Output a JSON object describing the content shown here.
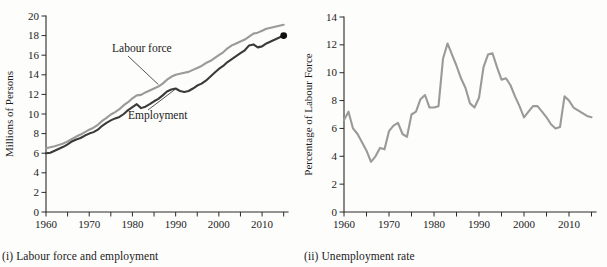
{
  "figure": {
    "background_color": "#fdfdfb",
    "panels": [
      {
        "id": "labour-force-and-employment",
        "caption": "(i) Labour force and employment"
      },
      {
        "id": "unemployment-rate",
        "caption": "(ii) Unemployment rate"
      }
    ]
  },
  "chart_data": [
    {
      "type": "line",
      "title": "",
      "caption": "(i) Labour force and employment",
      "xlabel": "Year",
      "ylabel": "Millions of Persons",
      "xlim": [
        1960,
        2016
      ],
      "ylim": [
        0,
        20
      ],
      "xticks": [
        1960,
        1970,
        1980,
        1990,
        2000,
        2010
      ],
      "xtick_labels": [
        "1960",
        "1970",
        "1980",
        "1990",
        "2000",
        "2010"
      ],
      "xminor_step": 5,
      "yticks": [
        0,
        2,
        4,
        6,
        8,
        10,
        12,
        14,
        16,
        18,
        20
      ],
      "ytick_labels": [
        "0",
        "2",
        "4",
        "6",
        "8",
        "10",
        "12",
        "14",
        "16",
        "18",
        "20"
      ],
      "grid": false,
      "legend": "inline-annotations",
      "annotations": [
        {
          "text": "Labour force",
          "series": "Labour force"
        },
        {
          "text": "Employment",
          "series": "Employment"
        }
      ],
      "end_marker": {
        "series": "Employment",
        "x": 2015,
        "y": 18.0,
        "color": "#111111"
      },
      "x": [
        1960,
        1961,
        1962,
        1963,
        1964,
        1965,
        1966,
        1967,
        1968,
        1969,
        1970,
        1971,
        1972,
        1973,
        1974,
        1975,
        1976,
        1977,
        1978,
        1979,
        1980,
        1981,
        1982,
        1983,
        1984,
        1985,
        1986,
        1987,
        1988,
        1989,
        1990,
        1991,
        1992,
        1993,
        1994,
        1995,
        1996,
        1997,
        1998,
        1999,
        2000,
        2001,
        2002,
        2003,
        2004,
        2005,
        2006,
        2007,
        2008,
        2009,
        2010,
        2011,
        2012,
        2013,
        2014,
        2015
      ],
      "series": [
        {
          "name": "Labour force",
          "color": "#9a9a9a",
          "values": [
            6.5,
            6.6,
            6.7,
            6.85,
            7.0,
            7.2,
            7.45,
            7.7,
            7.9,
            8.15,
            8.4,
            8.6,
            8.9,
            9.3,
            9.6,
            9.95,
            10.2,
            10.5,
            10.9,
            11.2,
            11.6,
            11.9,
            11.95,
            12.2,
            12.4,
            12.6,
            12.8,
            13.1,
            13.5,
            13.8,
            14.0,
            14.1,
            14.2,
            14.3,
            14.5,
            14.7,
            14.9,
            15.2,
            15.4,
            15.7,
            16.0,
            16.3,
            16.7,
            17.0,
            17.2,
            17.4,
            17.6,
            17.9,
            18.2,
            18.3,
            18.5,
            18.7,
            18.8,
            18.9,
            19.0,
            19.1
          ]
        },
        {
          "name": "Employment",
          "color": "#3a3a3a",
          "values": [
            6.0,
            6.05,
            6.25,
            6.45,
            6.65,
            6.9,
            7.2,
            7.4,
            7.55,
            7.8,
            8.0,
            8.15,
            8.4,
            8.8,
            9.1,
            9.35,
            9.55,
            9.7,
            10.0,
            10.4,
            10.7,
            11.0,
            10.6,
            10.75,
            11.0,
            11.3,
            11.55,
            11.9,
            12.3,
            12.5,
            12.6,
            12.35,
            12.25,
            12.35,
            12.6,
            12.9,
            13.1,
            13.4,
            13.8,
            14.2,
            14.6,
            14.9,
            15.3,
            15.6,
            15.9,
            16.2,
            16.5,
            17.0,
            17.1,
            16.8,
            16.9,
            17.2,
            17.4,
            17.6,
            17.8,
            18.0
          ]
        }
      ]
    },
    {
      "type": "line",
      "title": "",
      "caption": "(ii) Unemployment rate",
      "xlabel": "Year",
      "ylabel": "Percentage of Labour Force",
      "xlim": [
        1960,
        2016
      ],
      "ylim": [
        0,
        14
      ],
      "xticks": [
        1960,
        1970,
        1980,
        1990,
        2000,
        2010
      ],
      "xtick_labels": [
        "1960",
        "1970",
        "1980",
        "1990",
        "2000",
        "2010"
      ],
      "xminor_step": 5,
      "yticks": [
        0,
        2,
        4,
        6,
        8,
        10,
        12,
        14
      ],
      "ytick_labels": [
        "0",
        "2",
        "4",
        "6",
        "8",
        "10",
        "12",
        "14"
      ],
      "grid": false,
      "legend": "none",
      "x": [
        1960,
        1961,
        1962,
        1963,
        1964,
        1965,
        1966,
        1967,
        1968,
        1969,
        1970,
        1971,
        1972,
        1973,
        1974,
        1975,
        1976,
        1977,
        1978,
        1979,
        1980,
        1981,
        1982,
        1983,
        1984,
        1985,
        1986,
        1987,
        1988,
        1989,
        1990,
        1991,
        1992,
        1993,
        1994,
        1995,
        1996,
        1997,
        1998,
        1999,
        2000,
        2001,
        2002,
        2003,
        2004,
        2005,
        2006,
        2007,
        2008,
        2009,
        2010,
        2011,
        2012,
        2013,
        2014,
        2015
      ],
      "series": [
        {
          "name": "Unemployment rate",
          "color": "#9a9a9a",
          "values": [
            6.6,
            7.2,
            6.0,
            5.6,
            5.0,
            4.4,
            3.6,
            4.0,
            4.6,
            4.5,
            5.8,
            6.2,
            6.4,
            5.6,
            5.4,
            7.0,
            7.2,
            8.1,
            8.4,
            7.5,
            7.5,
            7.6,
            11.0,
            12.1,
            11.3,
            10.5,
            9.6,
            8.9,
            7.8,
            7.5,
            8.2,
            10.4,
            11.3,
            11.4,
            10.4,
            9.5,
            9.6,
            9.1,
            8.3,
            7.6,
            6.8,
            7.2,
            7.6,
            7.6,
            7.2,
            6.8,
            6.3,
            6.0,
            6.1,
            8.3,
            8.0,
            7.5,
            7.3,
            7.1,
            6.9,
            6.8
          ]
        }
      ]
    }
  ]
}
